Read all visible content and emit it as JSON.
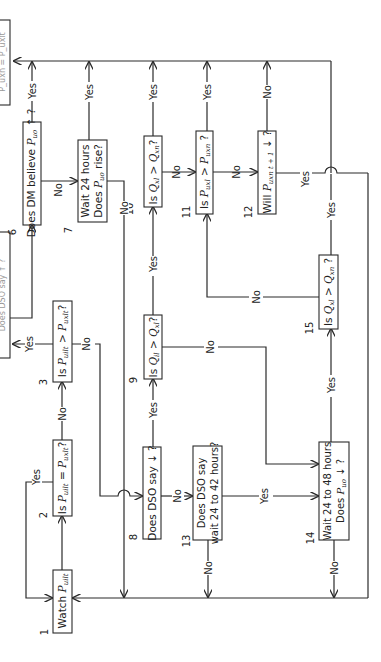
{
  "figure": {
    "orientation": "rotated-90-ccw",
    "caption_visible": false
  },
  "nodes": [
    {
      "id": "1",
      "number": "1",
      "lines": [
        "Watch P_uilt"
      ]
    },
    {
      "id": "2",
      "number": "2",
      "lines": [
        "Is P_uilt = P_uxlt?"
      ]
    },
    {
      "id": "3",
      "number": "3",
      "lines": [
        "Is P_uilt > P_uxlt?"
      ]
    },
    {
      "id": "6",
      "number": "6",
      "lines": [
        "Does DM believe P_uo ↑ ?"
      ]
    },
    {
      "id": "7",
      "number": "7",
      "lines": [
        "Wait 24 hours",
        "Does P_uo rise?"
      ]
    },
    {
      "id": "8",
      "number": "8",
      "lines": [
        "Does DSO say ↓ ?"
      ]
    },
    {
      "id": "9",
      "number": "9",
      "lines": [
        "Is Q_il > Q_xl?"
      ]
    },
    {
      "id": "10",
      "number": "10",
      "lines": [
        "Is Q_xl > Q_xn?"
      ]
    },
    {
      "id": "11",
      "number": "11",
      "lines": [
        "Is P_uxl > P_uxn ?"
      ]
    },
    {
      "id": "12",
      "number": "12",
      "lines": [
        "Will P_uxn t+1 ↓ ?"
      ]
    },
    {
      "id": "13",
      "number": "13",
      "lines": [
        "Does DSO say",
        "wait 24 to 42 hours?"
      ]
    },
    {
      "id": "14",
      "number": "14",
      "lines": [
        "Wait 24 to 48 hours",
        "Does P_uo ↓ ?"
      ]
    },
    {
      "id": "15",
      "number": "15",
      "lines": [
        "Is Q_xl > Q_xn ?"
      ]
    },
    {
      "id": "4",
      "number": "",
      "lines": [
        "Does DSO say ↑ ?"
      ],
      "partial": true
    },
    {
      "id": "5",
      "number": "",
      "lines": [
        "P_uxn = P_uxlt"
      ],
      "partial": true
    }
  ],
  "text": {
    "n1": "Watch ",
    "n1_sym": "P",
    "n1_sub": "uilt",
    "n2_a": "Is ",
    "n2_sym1": "P",
    "n2_sub1": "uilt",
    "n2_op": " = ",
    "n2_sym2": "P",
    "n2_sub2": "uxlt",
    "n2_q": "?",
    "n3_a": "Is ",
    "n3_sym1": "P",
    "n3_sub1": "uilt",
    "n3_op": " > ",
    "n3_sym2": "P",
    "n3_sub2": "uxlt",
    "n3_q": "?",
    "n6_a": "Does DM believe ",
    "n6_sym": "P",
    "n6_sub": "uo",
    "n6_b": " ↑ ?",
    "n7_l1": "Wait 24 hours",
    "n7_a": "Does ",
    "n7_sym": "P",
    "n7_sub": "uo",
    "n7_b": " rise?",
    "n8": "Does DSO say ↓ ?",
    "n9_a": "Is ",
    "n9_sym1": "Q",
    "n9_sub1": "il",
    "n9_op": " > ",
    "n9_sym2": "Q",
    "n9_sub2": "xl",
    "n9_q": "?",
    "n10_a": "Is ",
    "n10_sym1": "Q",
    "n10_sub1": "xl",
    "n10_op": " > ",
    "n10_sym2": "Q",
    "n10_sub2": "xn",
    "n10_q": "?",
    "n11_a": "Is ",
    "n11_sym1": "P",
    "n11_sub1": "uxl",
    "n11_op": " > ",
    "n11_sym2": "P",
    "n11_sub2": "uxn",
    "n11_q": " ?",
    "n12_a": "Will ",
    "n12_sym": "P",
    "n12_sub": "uxn t + 1",
    "n12_b": " ↓ ?",
    "n13_l1": "Does DSO say",
    "n13_l2": "wait 24 to 42 hours?",
    "n14_l1": "Wait 24 to 48 hours",
    "n14_a": "Does ",
    "n14_sym": "P",
    "n14_sub": "uo",
    "n14_b": " ↓ ?",
    "n15_a": "Is ",
    "n15_sym1": "Q",
    "n15_sub1": "xl",
    "n15_op": " > ",
    "n15_sym2": "Q",
    "n15_sub2": "xn",
    "n15_q": " ?",
    "n4_partial": "Does DSO say ↑ ?",
    "n5_partial": "P_uxn = P_uxlt"
  },
  "numbers": {
    "n1": "1",
    "n2": "2",
    "n3": "3",
    "n6": "6",
    "n7": "7",
    "n8": "8",
    "n9": "9",
    "n10": "10",
    "n11": "11",
    "n12": "12",
    "n13": "13",
    "n14": "14",
    "n15": "15"
  },
  "edge_labels": {
    "yes": "Yes",
    "no": "No"
  }
}
